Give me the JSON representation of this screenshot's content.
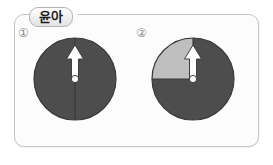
{
  "panel": {
    "name_tab": {
      "label": "윤아"
    },
    "background_color": "#fcfcfc",
    "border_color": "#c3c3c3"
  },
  "colors": {
    "dark_gray": "#4d4d4d",
    "light_gray": "#bfbfbf",
    "outline": "#3a3a3a",
    "arrow_fill": "#ffffff",
    "arrow_outline": "#3f3f3f"
  },
  "figures": [
    {
      "number_label": "①",
      "name": "circle-diagram-1",
      "description": "full dark gray circle divided by a vertical radius line from center to top",
      "fill_all": "#4d4d4d",
      "highlight_sector": null,
      "divider": "vertical-radius-up",
      "arrow": {
        "direction": "up",
        "from": "center",
        "color": "#ffffff"
      }
    },
    {
      "number_label": "②",
      "name": "circle-diagram-2",
      "description": "dark gray circle with a light gray quarter sector in the upper-left quadrant",
      "fill_all": "#4d4d4d",
      "highlight_sector": {
        "quadrant": "upper-left",
        "start_angle_deg": 90,
        "sweep_deg": 90,
        "color": "#bfbfbf"
      },
      "divider": "vertical-radius-up-and-horizontal-radius-left",
      "arrow": {
        "direction": "up",
        "from": "center",
        "color": "#ffffff"
      }
    }
  ]
}
